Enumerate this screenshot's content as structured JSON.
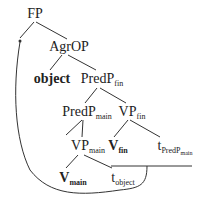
{
  "diagram": {
    "type": "syntax-tree",
    "nodes": {
      "fp": {
        "label": "FP"
      },
      "agrop": {
        "label": "AgrOP"
      },
      "object": {
        "label": "object"
      },
      "predp_fin": {
        "label": "PredP",
        "sub": "fin"
      },
      "predp_main": {
        "label": "PredP",
        "sub": "main"
      },
      "vp_fin": {
        "label": "VP",
        "sub": "fin"
      },
      "vp_main": {
        "label": "VP",
        "sub": "main"
      },
      "v_fin": {
        "label": "V",
        "sub": "fin"
      },
      "t_predp_main": {
        "label": "t",
        "sub": "PredP",
        "subsub": "main"
      },
      "v_main": {
        "label": "V",
        "sub": "main"
      },
      "t_object": {
        "label": "t",
        "sub": "object"
      }
    },
    "edges": [
      [
        "fp",
        "agrop"
      ],
      [
        "agrop",
        "object"
      ],
      [
        "agrop",
        "predp_fin"
      ],
      [
        "predp_fin",
        "predp_main"
      ],
      [
        "predp_fin",
        "vp_fin"
      ],
      [
        "predp_main",
        "vp_main"
      ],
      [
        "vp_fin",
        "v_fin"
      ],
      [
        "vp_fin",
        "t_predp_main"
      ],
      [
        "vp_main",
        "v_main"
      ],
      [
        "vp_main",
        "t_object"
      ]
    ],
    "movement_arrow": {
      "from": "t_object / V_fin-t_PredPmain bracket",
      "to": "FP specifier"
    }
  }
}
